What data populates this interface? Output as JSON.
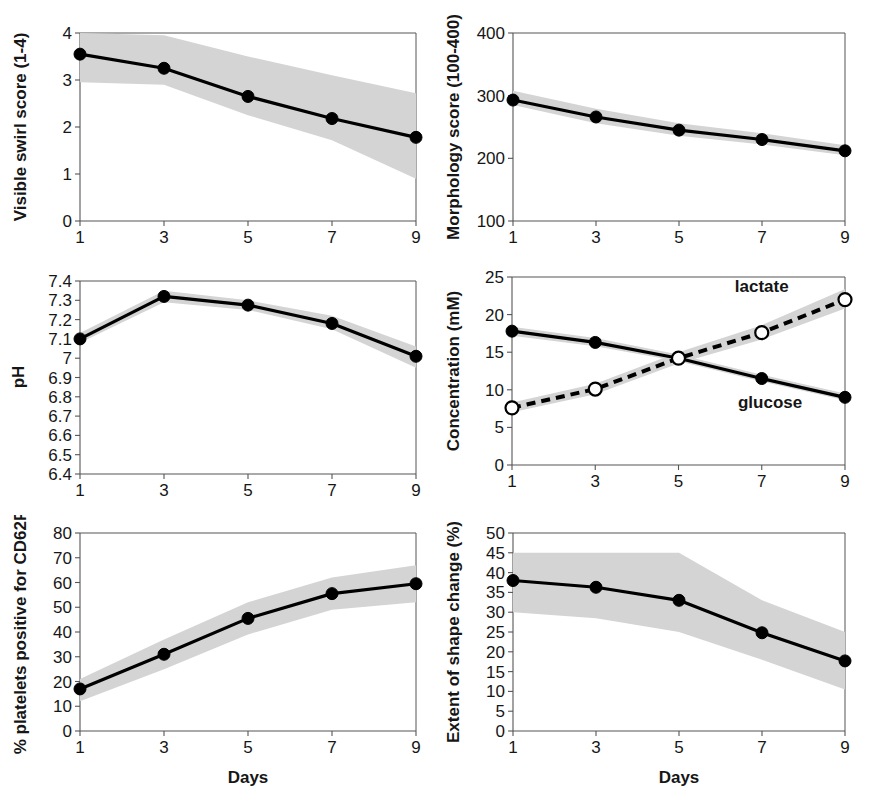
{
  "figure": {
    "xlabel": "Days",
    "band_color": "#d4d4d4",
    "line_color": "#000000",
    "axis_color": "#555555"
  },
  "chart_data": [
    {
      "id": "visible-swirl-score",
      "type": "line",
      "title": "",
      "xlabel": "",
      "ylabel": "Visible swirl score (1-4)",
      "x": [
        1,
        3,
        5,
        7,
        9
      ],
      "xticklabels": [
        "1",
        "3",
        "5",
        "7",
        "9"
      ],
      "xlim": [
        1,
        9
      ],
      "ylim": [
        0,
        4
      ],
      "yticks": [
        0,
        1,
        2,
        3,
        4
      ],
      "yticklabels": [
        "0",
        "1",
        "2",
        "3",
        "4"
      ],
      "grid": false,
      "legend": "none",
      "series": [
        {
          "name": "visible swirl score",
          "marker": "filled-circle",
          "linestyle": "solid",
          "values": [
            3.55,
            3.25,
            2.65,
            2.18,
            1.78
          ],
          "band_upper": [
            4.0,
            3.95,
            3.5,
            3.1,
            2.72
          ],
          "band_lower": [
            2.95,
            2.9,
            2.25,
            1.72,
            0.9
          ]
        }
      ]
    },
    {
      "id": "morphology-score",
      "type": "line",
      "title": "",
      "xlabel": "",
      "ylabel": "Morphology score (100-400)",
      "x": [
        1,
        3,
        5,
        7,
        9
      ],
      "xticklabels": [
        "1",
        "3",
        "5",
        "7",
        "9"
      ],
      "xlim": [
        1,
        9
      ],
      "ylim": [
        100,
        400
      ],
      "yticks": [
        100,
        200,
        300,
        400
      ],
      "yticklabels": [
        "100",
        "200",
        "300",
        "400"
      ],
      "grid": false,
      "legend": "none",
      "series": [
        {
          "name": "morphology score",
          "marker": "filled-circle",
          "linestyle": "solid",
          "values": [
            293,
            266,
            245,
            230,
            212
          ],
          "band_upper": [
            308,
            279,
            256,
            240,
            221
          ],
          "band_lower": [
            285,
            256,
            236,
            222,
            205
          ]
        }
      ]
    },
    {
      "id": "ph",
      "type": "line",
      "title": "",
      "xlabel": "",
      "ylabel": "pH",
      "x": [
        1,
        3,
        5,
        7,
        9
      ],
      "xticklabels": [
        "1",
        "3",
        "5",
        "7",
        "9"
      ],
      "xlim": [
        1,
        9
      ],
      "ylim": [
        6.4,
        7.4
      ],
      "yticks": [
        6.4,
        6.5,
        6.6,
        6.7,
        6.8,
        6.9,
        7.0,
        7.1,
        7.2,
        7.3,
        7.4
      ],
      "yticklabels": [
        "6.4",
        "6.5",
        "6.6",
        "6.7",
        "6.8",
        "6.9",
        "7",
        "7.1",
        "7.2",
        "7.3",
        "7.4"
      ],
      "grid": false,
      "legend": "none",
      "series": [
        {
          "name": "pH",
          "marker": "filled-circle",
          "linestyle": "solid",
          "values": [
            7.1,
            7.32,
            7.275,
            7.18,
            7.01
          ],
          "band_upper": [
            7.13,
            7.35,
            7.3,
            7.22,
            7.06
          ],
          "band_lower": [
            7.08,
            7.29,
            7.25,
            7.15,
            6.95
          ]
        }
      ]
    },
    {
      "id": "concentration",
      "type": "line",
      "title": "",
      "xlabel": "",
      "ylabel": "Concentration (mM)",
      "x": [
        1,
        3,
        5,
        7,
        9
      ],
      "xticklabels": [
        "1",
        "3",
        "5",
        "7",
        "9"
      ],
      "xlim": [
        1,
        9
      ],
      "ylim": [
        0,
        25
      ],
      "yticks": [
        0,
        5,
        10,
        15,
        20,
        25
      ],
      "yticklabels": [
        "0",
        "5",
        "10",
        "15",
        "20",
        "25"
      ],
      "grid": false,
      "legend": "inline-annotations",
      "annotations": [
        {
          "text": "lactate",
          "x": 7.0,
          "y": 23.0
        },
        {
          "text": "glucose",
          "x": 7.2,
          "y": 7.6
        }
      ],
      "series": [
        {
          "name": "glucose",
          "marker": "filled-circle",
          "linestyle": "solid",
          "values": [
            17.8,
            16.3,
            14.2,
            11.5,
            9.0
          ],
          "band_upper": [
            18.4,
            16.9,
            14.7,
            12.0,
            9.5
          ],
          "band_lower": [
            17.2,
            15.8,
            13.8,
            11.1,
            8.6
          ]
        },
        {
          "name": "lactate",
          "marker": "open-circle",
          "linestyle": "dashed",
          "values": [
            7.6,
            10.1,
            14.2,
            17.6,
            22.0
          ],
          "band_upper": [
            8.3,
            10.8,
            15.0,
            18.6,
            23.4
          ],
          "band_lower": [
            7.0,
            9.4,
            13.5,
            16.7,
            20.8
          ]
        }
      ]
    },
    {
      "id": "cd62p-positive",
      "type": "line",
      "title": "",
      "xlabel": "Days",
      "ylabel": "% platelets positive for CD62P",
      "x": [
        1,
        3,
        5,
        7,
        9
      ],
      "xticklabels": [
        "1",
        "3",
        "5",
        "7",
        "9"
      ],
      "xlim": [
        1,
        9
      ],
      "ylim": [
        0,
        80
      ],
      "yticks": [
        0,
        10,
        20,
        30,
        40,
        50,
        60,
        70,
        80
      ],
      "yticklabels": [
        "0",
        "10",
        "20",
        "30",
        "40",
        "50",
        "60",
        "70",
        "80"
      ],
      "grid": false,
      "legend": "none",
      "series": [
        {
          "name": "% platelets positive for CD62P",
          "marker": "filled-circle",
          "linestyle": "solid",
          "values": [
            17,
            31,
            45.5,
            55.5,
            59.5
          ],
          "band_upper": [
            21,
            37,
            52,
            62,
            67
          ],
          "band_lower": [
            12,
            25,
            39,
            49,
            52
          ]
        }
      ]
    },
    {
      "id": "extent-shape-change",
      "type": "line",
      "title": "",
      "xlabel": "Days",
      "ylabel": "Extent of shape change (%)",
      "x": [
        1,
        3,
        5,
        7,
        9
      ],
      "xticklabels": [
        "1",
        "3",
        "5",
        "7",
        "9"
      ],
      "xlim": [
        1,
        9
      ],
      "ylim": [
        0,
        50
      ],
      "yticks": [
        0,
        5,
        10,
        15,
        20,
        25,
        30,
        35,
        40,
        45,
        50
      ],
      "yticklabels": [
        "0",
        "5",
        "10",
        "15",
        "20",
        "25",
        "30",
        "35",
        "40",
        "45",
        "50"
      ],
      "grid": false,
      "legend": "none",
      "series": [
        {
          "name": "extent of shape change",
          "marker": "filled-circle",
          "linestyle": "solid",
          "values": [
            38.0,
            36.3,
            33.0,
            24.8,
            17.7
          ],
          "band_upper": [
            45.0,
            45.0,
            45.0,
            33.0,
            25.0
          ],
          "band_lower": [
            30.0,
            28.5,
            25.0,
            18.0,
            10.5
          ]
        }
      ]
    }
  ]
}
